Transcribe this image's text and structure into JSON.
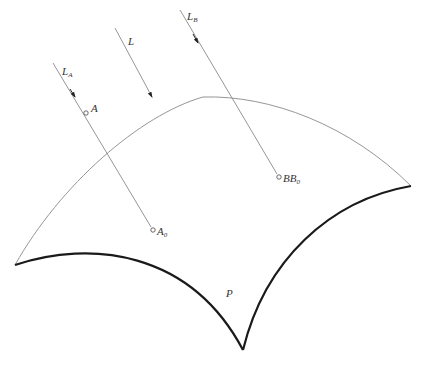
{
  "diagram": {
    "title_faint": "",
    "caption_faint": "",
    "labels": {
      "L": "L",
      "LA_main": "L",
      "LA_sub": "A",
      "LB_main": "L",
      "LB_sub": "B",
      "A": "A",
      "A0_main": "A",
      "A0_sub": "0",
      "BB0_main": "BB",
      "BB0_sub": "0",
      "P": "P"
    },
    "colors": {
      "thin_line": "#8a8a8a",
      "thick_line": "#1a1a1a",
      "text": "#333333"
    },
    "rays": [
      {
        "name": "L_A",
        "from": [
          53,
          63
        ],
        "to": [
          153,
          230
        ],
        "arrow_at": [
          74,
          96
        ]
      },
      {
        "name": "L",
        "from": [
          115,
          28
        ],
        "to": [
          152,
          97
        ],
        "arrow_at": [
          152,
          97
        ]
      },
      {
        "name": "L_B",
        "from": [
          180,
          10
        ],
        "to": [
          279,
          177
        ],
        "arrow_at": [
          197,
          44
        ]
      }
    ],
    "points": [
      {
        "name": "A",
        "at": [
          86,
          113
        ]
      },
      {
        "name": "A0",
        "at": [
          153,
          230
        ]
      },
      {
        "name": "BB0",
        "at": [
          279,
          177
        ]
      }
    ],
    "surface": {
      "name": "P",
      "corners": [
        [
          15,
          265
        ],
        [
          411,
          186
        ],
        [
          243,
          350
        ]
      ]
    }
  }
}
